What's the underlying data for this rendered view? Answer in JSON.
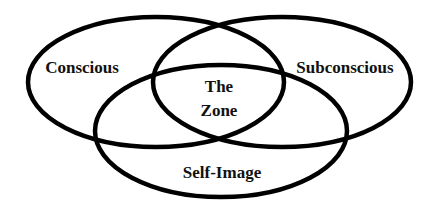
{
  "diagram": {
    "type": "venn",
    "stroke_color": "#000000",
    "background": "#ffffff",
    "sets": [
      {
        "id": "conscious",
        "label": "Conscious",
        "shape": "ellipse",
        "cx": 156,
        "cy": 82,
        "rx": 128,
        "ry": 65
      },
      {
        "id": "subconscious",
        "label": "Subconscious",
        "shape": "ellipse",
        "cx": 282,
        "cy": 82,
        "rx": 129,
        "ry": 65
      },
      {
        "id": "self-image",
        "label": "Self-Image",
        "shape": "ellipse",
        "cx": 221,
        "cy": 131,
        "rx": 126,
        "ry": 66
      }
    ],
    "intersection": {
      "label_line1": "The",
      "label_line2": "Zone",
      "of": [
        "conscious",
        "subconscious",
        "self-image"
      ]
    }
  }
}
